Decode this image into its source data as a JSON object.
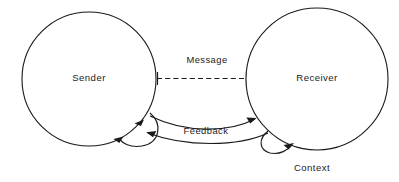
{
  "diagram": {
    "type": "node-link-diagram",
    "background_color": "#ffffff",
    "stroke_color": "#1a1a1a",
    "text_color": "#1d1d1d",
    "nodes": [
      {
        "id": "sender",
        "label": "Sender",
        "shape": "circle",
        "cx": 89,
        "cy": 79,
        "r": 67
      },
      {
        "id": "receiver",
        "label": "Receiver",
        "shape": "circle",
        "cx": 317,
        "cy": 79,
        "r": 71
      }
    ],
    "edges": [
      {
        "id": "message",
        "label": "Message",
        "from": "sender",
        "to": "receiver",
        "style": "dashed",
        "arrow": "none",
        "endcaps": "tick-marks",
        "label_x": 207,
        "label_y": 61
      },
      {
        "id": "feedback-upper",
        "label": "Feedback",
        "from": "sender",
        "to": "receiver",
        "style": "solid-curve",
        "arrow": "end",
        "label_x": 206,
        "label_y": 132
      },
      {
        "id": "feedback-lower",
        "label": "",
        "from": "receiver",
        "to": "sender",
        "style": "solid-curve",
        "arrow": "end"
      },
      {
        "id": "sender-self-loop",
        "label": "",
        "from": "sender",
        "to": "sender",
        "style": "solid-arc",
        "arrow": "both"
      },
      {
        "id": "receiver-self-loop",
        "label": "",
        "from": "receiver",
        "to": "receiver",
        "style": "solid-arc",
        "arrow": "end"
      }
    ],
    "annotations": [
      {
        "id": "context",
        "label": "Context",
        "x": 312,
        "y": 168
      }
    ]
  }
}
